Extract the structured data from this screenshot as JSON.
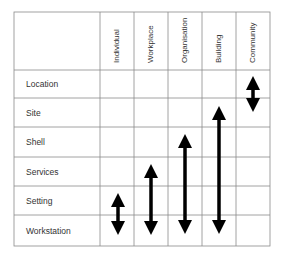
{
  "diagram": {
    "columns": [
      {
        "label": "Individual",
        "arrow": {
          "from": "Setting",
          "to": "Workstation"
        }
      },
      {
        "label": "Workplace",
        "arrow": {
          "from": "Services",
          "to": "Workstation"
        }
      },
      {
        "label": "Organisation",
        "arrow": {
          "from": "Shell",
          "to": "Workstation"
        }
      },
      {
        "label": "Building",
        "arrow": {
          "from": "Site",
          "to": "Workstation"
        }
      },
      {
        "label": "Community",
        "arrow": {
          "from": "Location",
          "to": "Site"
        }
      }
    ],
    "rows": [
      {
        "label": "Location"
      },
      {
        "label": "Site"
      },
      {
        "label": "Shell"
      },
      {
        "label": "Services"
      },
      {
        "label": "Setting"
      },
      {
        "label": "Workstation"
      }
    ],
    "colors": {
      "grid": "#8a8a8a",
      "arrow": "#000000",
      "text": "#333333"
    }
  }
}
